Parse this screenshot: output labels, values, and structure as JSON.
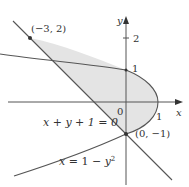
{
  "diagram": {
    "title": "",
    "region_fill": "#e4e4e4",
    "curve_color": "#555555",
    "axis_color": "#555555",
    "axes": {
      "x_label": "x",
      "y_label": "y",
      "origin_label": "0",
      "x_tick_labels": [
        "1"
      ],
      "y_tick_labels": [
        "1",
        "2"
      ]
    },
    "curves": [
      {
        "name": "parabola",
        "label": "x = 1 − y²",
        "label_parts": {
          "lhs": "x",
          "eq": " = 1 − ",
          "var": "y",
          "sup": "2"
        }
      },
      {
        "name": "line",
        "label": "x + y + 1 = 0"
      }
    ],
    "points": [
      {
        "label": "(−3, 2)",
        "x": -3,
        "y": 2
      },
      {
        "label": "(0, −1)",
        "x": 0,
        "y": -1
      }
    ],
    "shaded_region": "bounded by x = 1 − y² and x + y + 1 = 0"
  }
}
